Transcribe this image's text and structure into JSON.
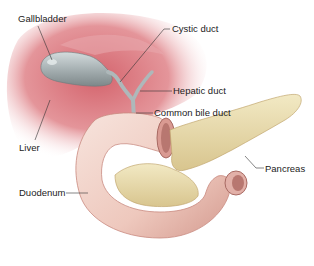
{
  "diagram": {
    "labels": {
      "gallbladder": "Gallbladder",
      "cystic_duct": "Cystic duct",
      "hepatic_duct": "Hepatic duct",
      "common_bile_duct": "Common bile duct",
      "liver": "Liver",
      "pancreas": "Pancreas",
      "duodenum": "Duodenum"
    },
    "colors": {
      "liver": "#c9525e",
      "liver_light": "#f3d6d8",
      "gallbladder": "#a8b2b4",
      "duct": "#b9c3c5",
      "duodenum": "#f0cfc6",
      "duodenum_shadow": "#c98a80",
      "pancreas": "#e8dcae",
      "pancreas_shadow": "#c9b27a",
      "leader_line": "#333333"
    }
  }
}
